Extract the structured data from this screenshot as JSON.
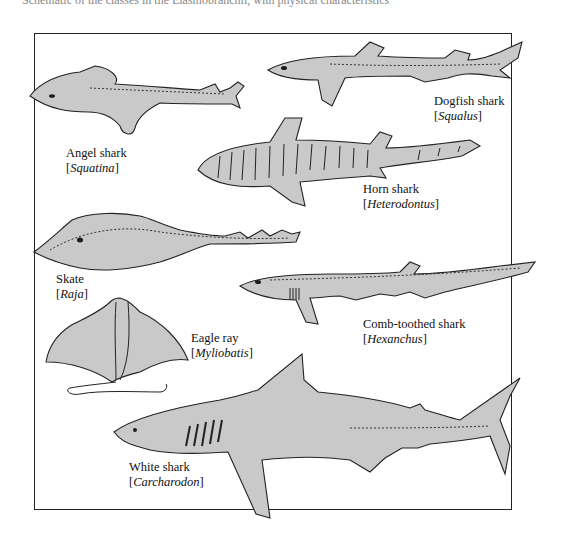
{
  "caption_partial": "Schematic of the classes in the Elasmobranchii, with physical characteristics",
  "figure": {
    "species": [
      {
        "common": "Angel shark",
        "genus": "Squatina"
      },
      {
        "common": "Dogfish shark",
        "genus": "Squalus"
      },
      {
        "common": "Horn shark",
        "genus": "Heterodontus"
      },
      {
        "common": "Skate",
        "genus": "Raja"
      },
      {
        "common": "Comb-toothed shark",
        "genus": "Hexanchus"
      },
      {
        "common": "Eagle ray",
        "genus": "Myliobatis"
      },
      {
        "common": "White shark",
        "genus": "Carcharodon"
      }
    ]
  },
  "colors": {
    "body_fill": "#c9c9c9",
    "outline": "#222222",
    "background": "#ffffff"
  }
}
